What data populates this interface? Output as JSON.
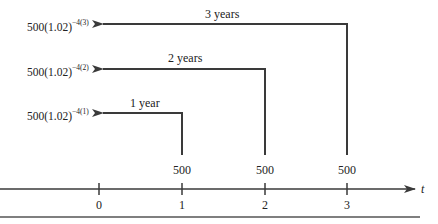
{
  "diagram": {
    "type": "time-diagram",
    "axis": {
      "variable": "t",
      "ticks": [
        "0",
        "1",
        "2",
        "3"
      ]
    },
    "payments": [
      {
        "time": "1",
        "amount": "500",
        "duration_label": "1 year",
        "pv_base": "500(1.02)",
        "pv_exponent": "−4(1)"
      },
      {
        "time": "2",
        "amount": "500",
        "duration_label": "2 years",
        "pv_base": "500(1.02)",
        "pv_exponent": "−4(2)"
      },
      {
        "time": "3",
        "amount": "500",
        "duration_label": "3 years",
        "pv_base": "500(1.02)",
        "pv_exponent": "−4(3)"
      }
    ],
    "colors": {
      "line": "#3a3a3a",
      "text": "#222222"
    }
  }
}
